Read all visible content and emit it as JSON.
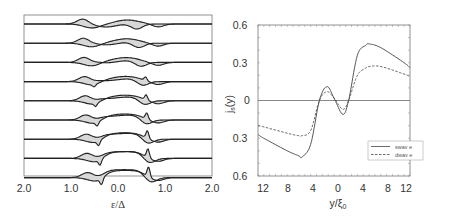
{
  "chart_data": [
    {
      "type": "line",
      "panel": "left",
      "title": "",
      "xlabel": "ε/Δ",
      "ylabel": "",
      "xticks": [
        "2.0",
        "1.0",
        "0.0",
        "1.0",
        "2.0"
      ],
      "xlim": [
        -2.0,
        2.0
      ],
      "grid": false,
      "description": "Stacked local density of states curves (9 traces), each with shaded difference region; vertically offset",
      "n_traces": 9
    },
    {
      "type": "line",
      "panel": "right",
      "title": "",
      "xlabel": "y/ξ0",
      "ylabel": "js(y)",
      "xticks": [
        "12",
        "8",
        "4",
        "0",
        "4",
        "8",
        "12"
      ],
      "yticks": [
        "0.6",
        "0.3",
        "0",
        "0.3",
        "0.6"
      ],
      "xlim": [
        -13,
        13
      ],
      "ylim": [
        -0.6,
        0.6
      ],
      "grid": false,
      "legend": {
        "position": "lower right",
        "entries": [
          "swav e",
          "dwav e"
        ]
      },
      "x": [
        -13,
        -12,
        -8,
        -6,
        -5.5,
        -4,
        -2.5,
        -1.2,
        0,
        1.5,
        2.5,
        4,
        5.5,
        6,
        8,
        12,
        13
      ],
      "series": [
        {
          "name": "swav e",
          "style": "solid",
          "values": [
            -0.27,
            -0.3,
            -0.4,
            -0.44,
            -0.45,
            -0.35,
            0.0,
            0.11,
            0.02,
            -0.11,
            0.0,
            0.36,
            0.44,
            0.45,
            0.42,
            0.3,
            0.26
          ]
        },
        {
          "name": "dwav e",
          "style": "dashed",
          "values": [
            -0.2,
            -0.21,
            -0.26,
            -0.28,
            -0.28,
            -0.24,
            0.0,
            0.07,
            0.02,
            -0.07,
            0.0,
            0.2,
            0.26,
            0.27,
            0.27,
            0.21,
            0.19
          ]
        }
      ]
    }
  ],
  "left": {
    "xlabel": "ε/Δ",
    "xticks": [
      "2.0",
      "1.0",
      "0.0",
      "1.0",
      "2.0"
    ]
  },
  "right": {
    "ylabel": "j",
    "ylabel_sub": "s",
    "ylabel_tail": "(y)",
    "xlabel": "y/ξ",
    "xlabel_sub": "0",
    "xticks": [
      "12",
      "8",
      "4",
      "0",
      "4",
      "8",
      "12"
    ],
    "yticks": [
      "0.6",
      "0.3",
      "0",
      "0.3",
      "0.6"
    ],
    "legend": [
      "swav e",
      "dwav e"
    ]
  }
}
